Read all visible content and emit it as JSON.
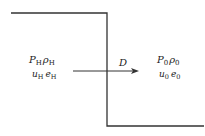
{
  "diagram": {
    "type": "shock-wave-step",
    "line_color": "#333333",
    "text_color": "#222222",
    "left_state": {
      "line1": [
        {
          "sym": "P",
          "sub": "H"
        },
        {
          "sym": "ρ",
          "sub": "H"
        }
      ],
      "line2": [
        {
          "sym": "u",
          "sub": "H"
        },
        {
          "sym": "e",
          "sub": "H"
        }
      ]
    },
    "right_state": {
      "line1": [
        {
          "sym": "P",
          "sub": "0"
        },
        {
          "sym": "ρ",
          "sub": "0"
        }
      ],
      "line2": [
        {
          "sym": "u",
          "sub": "0"
        },
        {
          "sym": "e",
          "sub": "0"
        }
      ]
    },
    "arrow_label": "D"
  }
}
